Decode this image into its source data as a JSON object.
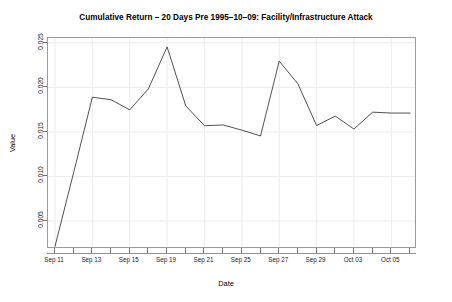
{
  "chart_data": {
    "type": "line",
    "title": "Cumulative Return – 20 Days Pre 1995–10–09: Facility/Infrastructure Attack",
    "xlabel": "Date",
    "ylabel": "Value",
    "grid": true,
    "legend": "none",
    "line_color": "#3d3d3d",
    "panel_border_color": "#9a9a9a",
    "grid_color": "#ececec",
    "background": "#ffffff",
    "xlim": [
      0,
      19
    ],
    "ylim": [
      0.00185,
      0.02555
    ],
    "y_ticks": [
      0.005,
      0.01,
      0.015,
      0.02,
      0.025
    ],
    "y_tick_labels": [
      "0.005",
      "0.010",
      "0.015",
      "0.020",
      "0.025"
    ],
    "x_tick_labels": [
      {
        "index": 0,
        "label": "Sep 11"
      },
      {
        "index": 2,
        "label": "Sep 13"
      },
      {
        "index": 4,
        "label": "Sep 15"
      },
      {
        "index": 6,
        "label": "Sep 19"
      },
      {
        "index": 8,
        "label": "Sep 21"
      },
      {
        "index": 10,
        "label": "Sep 25"
      },
      {
        "index": 12,
        "label": "Sep 27"
      },
      {
        "index": 14,
        "label": "Sep 29"
      },
      {
        "index": 16,
        "label": "Oct 03"
      },
      {
        "index": 18,
        "label": "Oct 05"
      }
    ],
    "x": [
      "Sep 11",
      "Sep 12",
      "Sep 13",
      "Sep 14",
      "Sep 15",
      "Sep 18",
      "Sep 19",
      "Sep 20",
      "Sep 21",
      "Sep 22",
      "Sep 25",
      "Sep 26",
      "Sep 27",
      "Sep 28",
      "Sep 29",
      "Oct 02",
      "Oct 03",
      "Oct 04",
      "Oct 05",
      "Oct 06"
    ],
    "values": [
      0.00215,
      0.01045,
      0.0189,
      0.01862,
      0.01748,
      0.01985,
      0.02455,
      0.01792,
      0.0157,
      0.01578,
      0.0152,
      0.01455,
      0.02295,
      0.0204,
      0.01572,
      0.01678,
      0.01532,
      0.01722,
      0.01712,
      0.01712
    ],
    "series_name": "Cumulative Return"
  }
}
